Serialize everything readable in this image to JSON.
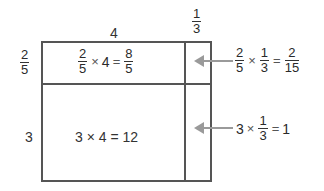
{
  "diagram": {
    "colors": {
      "border": "#555555",
      "arrow": "#9a9a9a",
      "text": "#333333"
    },
    "top_labels": {
      "whole": "4",
      "fraction": {
        "num": "1",
        "den": "3"
      }
    },
    "side_labels": {
      "fraction": {
        "num": "2",
        "den": "5"
      },
      "whole": "3"
    },
    "cells": {
      "top_left": {
        "a": {
          "num": "2",
          "den": "5"
        },
        "times": "×",
        "b": "4",
        "equals": "=",
        "result": {
          "num": "8",
          "den": "5"
        }
      },
      "bottom_left": {
        "expr": "3 × 4 = 12"
      }
    },
    "callouts": [
      {
        "a": {
          "num": "2",
          "den": "5"
        },
        "times": "×",
        "b": {
          "num": "1",
          "den": "3"
        },
        "equals": "=",
        "result": {
          "num": "2",
          "den": "15"
        },
        "arrow_icon": "arrow-left-icon"
      },
      {
        "a": "3",
        "times": "×",
        "b": {
          "num": "1",
          "den": "3"
        },
        "equals": "=",
        "result": "1",
        "arrow_icon": "arrow-left-icon"
      }
    ]
  }
}
